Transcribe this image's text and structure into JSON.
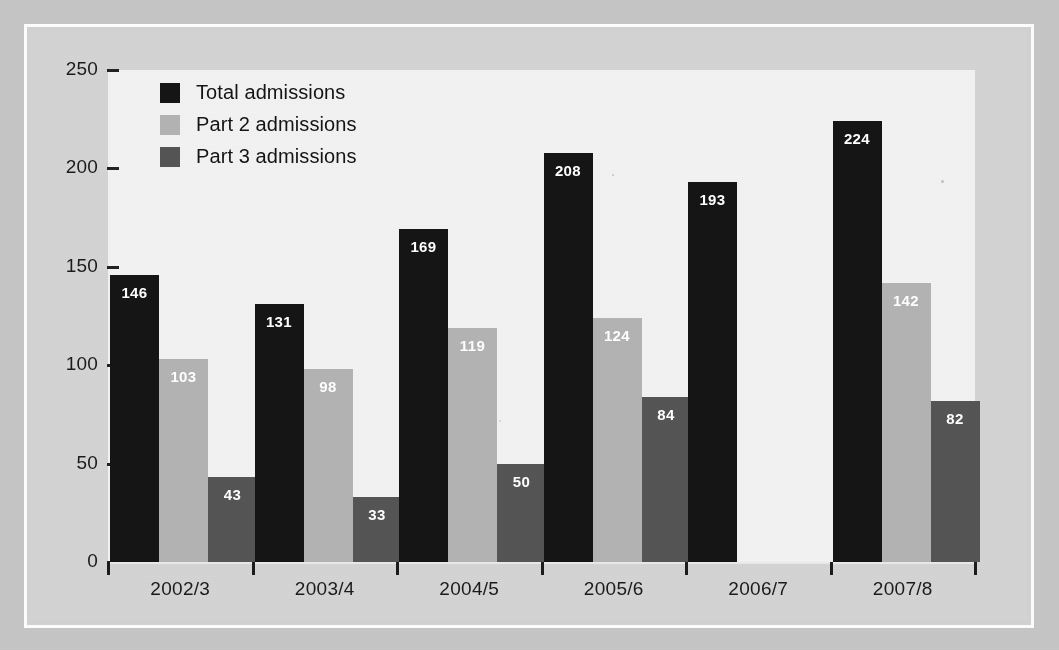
{
  "chart_data": {
    "type": "bar",
    "title": "",
    "xlabel": "",
    "ylabel": "",
    "ylim": [
      0,
      250
    ],
    "ytick_step": 50,
    "yticks": [
      0,
      50,
      100,
      150,
      200,
      250
    ],
    "ytick_labels": [
      "0",
      "50",
      "100",
      "150",
      "200",
      "250"
    ],
    "grid": false,
    "legend_position": "top-left inside plot",
    "categories": [
      "2002/3",
      "2003/4",
      "2004/5",
      "2005/6",
      "2006/7",
      "2007/8"
    ],
    "series": [
      {
        "name": "Total admissions",
        "color": "#151515",
        "values": [
          146,
          131,
          169,
          208,
          193,
          224
        ],
        "labels": [
          "146",
          "131",
          "169",
          "208",
          "193",
          "224"
        ]
      },
      {
        "name": "Part 2 admissions",
        "color": "#b3b3b3",
        "values": [
          103,
          98,
          119,
          124,
          null,
          142
        ],
        "labels": [
          "103",
          "98",
          "119",
          "124",
          "",
          "142"
        ]
      },
      {
        "name": "Part 3 admissions",
        "color": "#555555",
        "values": [
          43,
          33,
          50,
          84,
          null,
          82
        ],
        "labels": [
          "43",
          "33",
          "50",
          "84",
          "",
          "82"
        ]
      }
    ]
  },
  "legend": {
    "items": [
      {
        "label": "Total admissions",
        "color": "#151515"
      },
      {
        "label": "Part 2 admissions",
        "color": "#b3b3b3"
      },
      {
        "label": "Part 3 admissions",
        "color": "#555555"
      }
    ]
  },
  "colors": {
    "page_background": "#c6c6c6",
    "frame_border": "#fdfdfd",
    "inner_panel": "#d4d4d4",
    "plot_background": "#f2f2f2",
    "axis": "#1c1c1c",
    "tick_label": "#1b1b1b",
    "bar_value_label": "#ffffff"
  }
}
